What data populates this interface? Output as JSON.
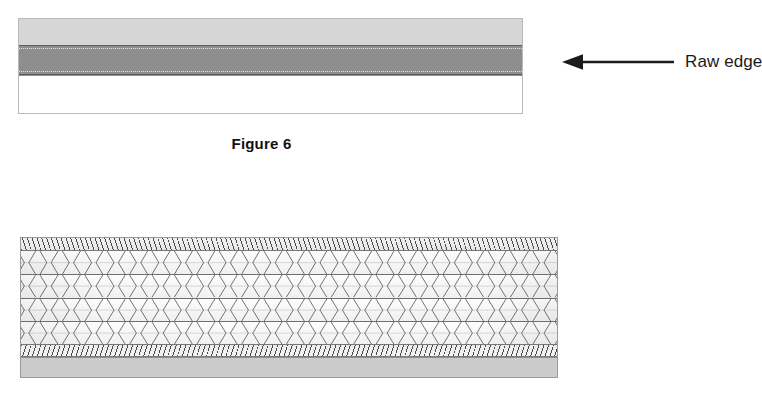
{
  "figure_top": {
    "name": "Figure 6",
    "caption": "Figure 6",
    "callout": {
      "label": "Raw edge",
      "arrow_icon": "arrow-left-icon",
      "arrow_direction": "left"
    },
    "layers": [
      {
        "id": "face",
        "name": "upper fabric layer",
        "color": "#d6d6d6",
        "fill": "solid-light-gray"
      },
      {
        "id": "core",
        "name": "raw edge band",
        "color": "#8e8e8e",
        "fill": "solid-dark-gray"
      },
      {
        "id": "back",
        "name": "lower fabric layer",
        "color": "#ffffff",
        "fill": "solid-white"
      }
    ],
    "border_color": "#b9b9b9"
  },
  "figure_bottom": {
    "name": "stitched seam cross-section",
    "bands": [
      {
        "id": "hatch-top",
        "name": "top selvedge hatching",
        "pattern": "fine-diagonal-hatch",
        "color": "#4a4a4a"
      },
      {
        "id": "zigzag-body",
        "name": "chevron stitch field",
        "pattern": "zigzag-chevron",
        "color": "#5a5a5a",
        "rows": 4
      },
      {
        "id": "hatch-bottom",
        "name": "bottom selvedge hatching",
        "pattern": "fine-diagonal-hatch",
        "color": "#4a4a4a"
      },
      {
        "id": "gray-plate",
        "name": "base plate",
        "pattern": "solid",
        "color": "#cbcbcb"
      }
    ],
    "border_color": "#9a9a9a"
  }
}
